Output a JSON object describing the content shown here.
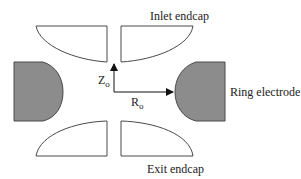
{
  "diagram": {
    "labels": {
      "inlet_endcap": "Inlet endcap",
      "exit_endcap": "Exit endcap",
      "ring_electrode": "Ring electrode",
      "z_axis": "Z",
      "z_subscript": "o",
      "r_axis": "R",
      "r_subscript": "o"
    },
    "colors": {
      "background": "#ffffff",
      "outline": "#4a4a4a",
      "electrode_fill": "#8c8c8c",
      "arrow": "#111111",
      "text": "#222222"
    },
    "elements": [
      {
        "name": "inlet-endcap-left",
        "type": "endcap"
      },
      {
        "name": "inlet-endcap-right",
        "type": "endcap"
      },
      {
        "name": "exit-endcap-left",
        "type": "endcap"
      },
      {
        "name": "exit-endcap-right",
        "type": "endcap"
      },
      {
        "name": "ring-electrode-left",
        "type": "ring"
      },
      {
        "name": "ring-electrode-right",
        "type": "ring"
      },
      {
        "name": "z-arrow",
        "type": "axis-arrow"
      },
      {
        "name": "r-arrow",
        "type": "axis-arrow"
      }
    ]
  }
}
